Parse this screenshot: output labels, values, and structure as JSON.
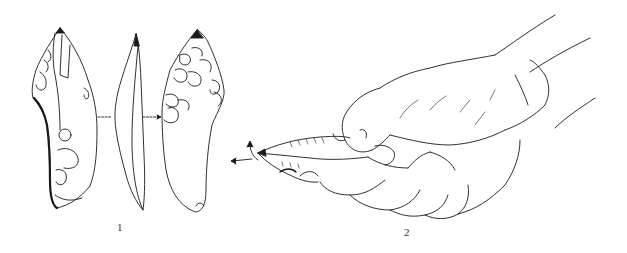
{
  "figure": {
    "type": "archaeological line illustration",
    "colors": {
      "ink": "#1a1a1a",
      "background": "#ffffff"
    },
    "panels": [
      {
        "id": 1,
        "label": "1",
        "subject": "flint point shown in three views (dorsal, profile, ventral) with connecting arrows"
      },
      {
        "id": 2,
        "label": "2",
        "subject": "hand gripping the flint tool, arrows indicating motion at the tip"
      }
    ]
  },
  "labels": {
    "panel_1": "1",
    "panel_2": "2"
  }
}
